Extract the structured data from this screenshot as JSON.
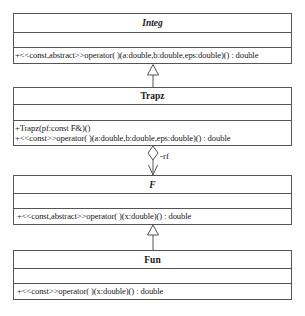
{
  "diagram": {
    "type": "UML class diagram",
    "classes": [
      {
        "name": "Integ",
        "abstract": true,
        "attributes": [],
        "operations": [
          "+<<const,abstract>>operator( )(a:double,b:double,eps:double)() : double"
        ]
      },
      {
        "name": "Trapz",
        "abstract": false,
        "attributes": [],
        "operations": [
          "+Trapz(pf:const F&)()",
          "+<<const>>operator( )(a:double,b:double,eps:double)() : double"
        ]
      },
      {
        "name": "F",
        "abstract": true,
        "attributes": [],
        "operations": [
          "+<<const,abstract>>operator( )(x:double)() : double"
        ]
      },
      {
        "name": "Fun",
        "abstract": false,
        "attributes": [],
        "operations": [
          "+<<const>>operator( )(x:double)() : double"
        ]
      }
    ],
    "relationships": [
      {
        "type": "generalization",
        "from": "Trapz",
        "to": "Integ"
      },
      {
        "type": "aggregation",
        "from": "Trapz",
        "to": "F",
        "role": "-rf"
      },
      {
        "type": "generalization",
        "from": "Fun",
        "to": "F"
      }
    ],
    "colors": {
      "line": "#555555",
      "text": "#1a1a1a",
      "background": "#ffffff"
    }
  }
}
